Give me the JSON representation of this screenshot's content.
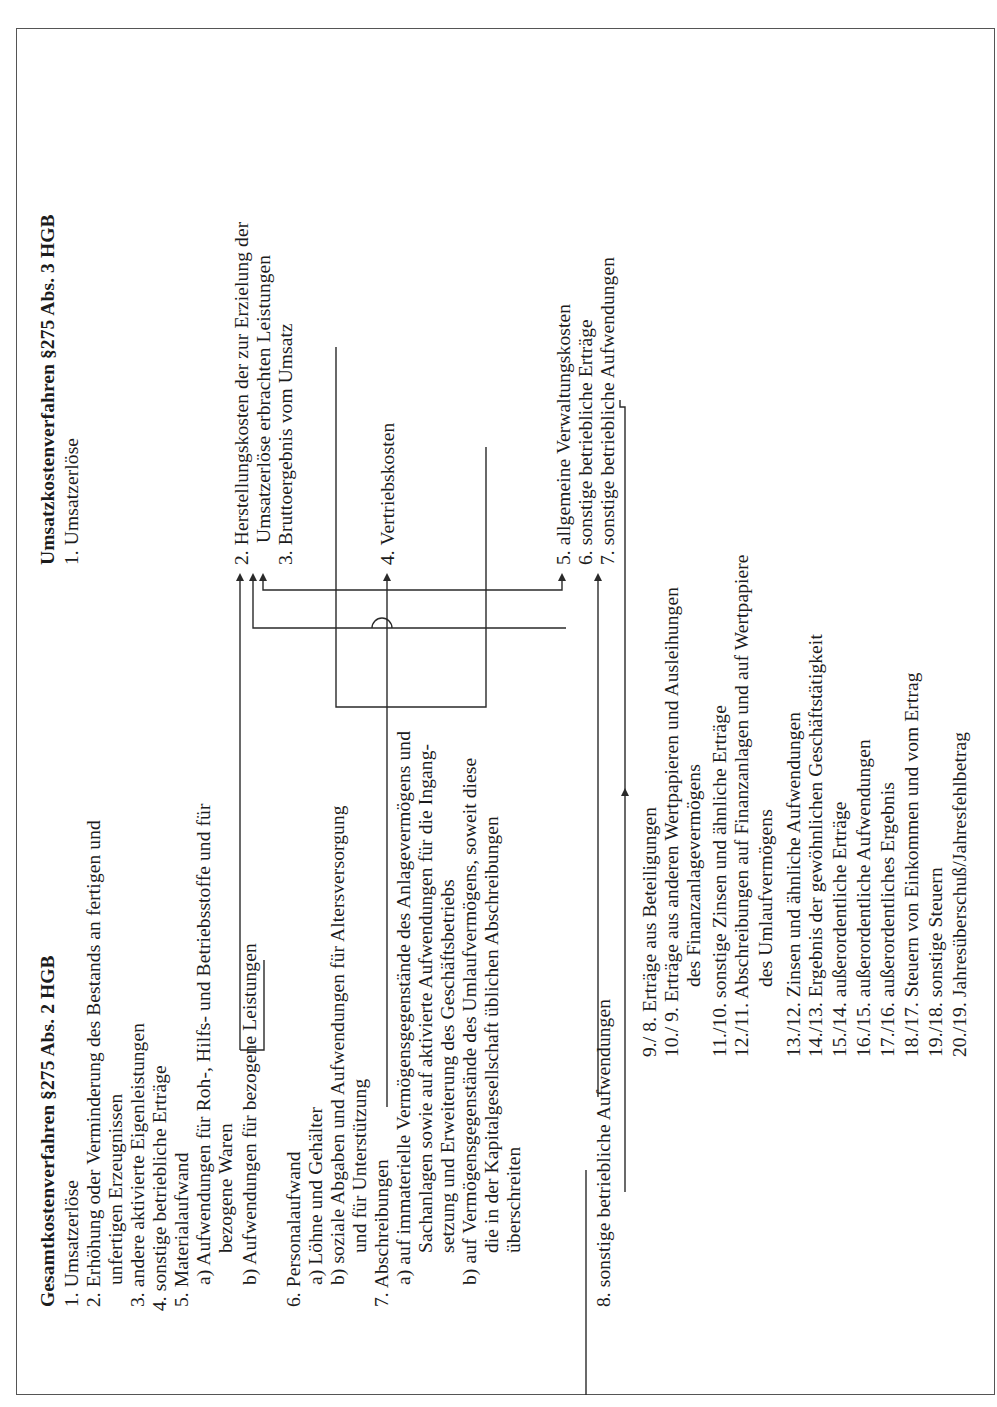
{
  "rotation": "page rotated 90° (landscape table printed sideways)",
  "ink_color": "#1c1c1c",
  "left": {
    "header": "Gesamtkostenverfahren §275 Abs. 2 HGB",
    "items": [
      "1. Umsatzerlöse",
      "2. Erhöhung oder Verminderung des Bestands an fertigen und",
      "unfertigen Erzeugnissen",
      "3. andere aktivierte Eigenleistungen",
      "4. sonstige betriebliche Erträge",
      "5. Materialaufwand",
      "a) Aufwendungen für Roh-, Hilfs- und Betriebsstoffe und für",
      "bezogene Waren",
      "b) Aufwendungen für bezogene Leistungen",
      "6. Personalaufwand",
      "a) Löhne und Gehälter",
      "b) soziale Abgaben und Aufwendungen für Altersversorgung",
      "und für Unterstützung",
      "7. Abschreibungen",
      "a) auf immaterielle Vermögensgegenstände des Anlagevermögens und",
      "Sachanlagen sowie auf aktivierte Aufwendungen für die Ingang-",
      "setzung und Erweiterung des Geschäftsbetriebs",
      "b) auf Vermögensgegenstände des Umlaufvermögens, soweit diese",
      "die in der Kapitalgesellschaft üblichen Abschreibungen",
      "überschreiten",
      "8. sonstige betriebliche Aufwendungen"
    ]
  },
  "right": {
    "header": "Umsatzkostenverfahren §275 Abs. 3 HGB",
    "items": [
      "1. Umsatzerlöse",
      "2. Herstellungskosten der zur Erzielung der",
      "Umsatzerlöse erbrachten Leistungen",
      "3. Bruttoergebnis vom Umsatz",
      "4. Vertriebskosten",
      "5. allgemeine Verwaltungskosten",
      "6. sonstige betriebliche Erträge",
      "7. sonstige betriebliche Aufwendungen"
    ]
  },
  "common": {
    "items": [
      "9./ 8. Erträge aus Beteiligungen",
      "10./ 9. Erträge aus anderen Wertpapieren und Ausleihungen",
      "des Finanzanlagevermögens",
      "11./10. sonstige Zinsen und ähnliche Erträge",
      "12./11. Abschreibungen auf Finanzanlagen und auf Wertpapiere",
      "des Umlaufvermögens",
      "13./12. Zinsen und ähnliche Aufwendungen",
      "14./13. Ergebnis der gewöhnlichen Geschäftstätigkeit",
      "15./14. außerordentliche Erträge",
      "16./15. außerordentliche Aufwendungen",
      "17./16. außerordentliches Ergebnis",
      "18./17. Steuern von Einkommen und vom Ertrag",
      "19./18. sonstige Steuern",
      "20./19. Jahresüberschuß/Jahresfehlbetrag"
    ]
  }
}
